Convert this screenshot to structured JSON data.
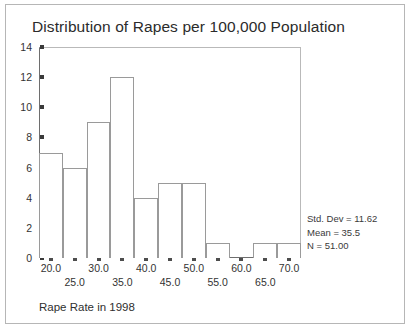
{
  "chart_data": {
    "type": "bar",
    "title": "Distribution of Rapes per 100,000 Population",
    "xlabel": "Rape Rate in 1998",
    "ylabel": "",
    "grid": false,
    "legend": "none",
    "xlim": [
      17.5,
      72.5
    ],
    "ylim": [
      0,
      14
    ],
    "bin_width": 5,
    "bin_starts": [
      17.5,
      22.5,
      27.5,
      32.5,
      37.5,
      42.5,
      47.5,
      52.5,
      57.5,
      62.5,
      67.5
    ],
    "categories": [
      "17.5-22.5",
      "22.5-27.5",
      "27.5-32.5",
      "32.5-37.5",
      "37.5-42.5",
      "42.5-47.5",
      "47.5-52.5",
      "52.5-57.5",
      "57.5-62.5",
      "62.5-67.5",
      "67.5-72.5"
    ],
    "values": [
      7,
      6,
      9,
      12,
      4,
      5,
      5,
      1,
      0,
      1,
      1
    ],
    "xticks": [
      {
        "value": 20.0,
        "label": "20.0",
        "row": 0
      },
      {
        "value": 25.0,
        "label": "25.0",
        "row": 1
      },
      {
        "value": 30.0,
        "label": "30.0",
        "row": 0
      },
      {
        "value": 35.0,
        "label": "35.0",
        "row": 1
      },
      {
        "value": 40.0,
        "label": "40.0",
        "row": 0
      },
      {
        "value": 45.0,
        "label": "45.0",
        "row": 1
      },
      {
        "value": 50.0,
        "label": "50.0",
        "row": 0
      },
      {
        "value": 55.0,
        "label": "55.0",
        "row": 1
      },
      {
        "value": 60.0,
        "label": "60.0",
        "row": 0
      },
      {
        "value": 65.0,
        "label": "65.0",
        "row": 1
      },
      {
        "value": 70.0,
        "label": "70.0",
        "row": 0
      }
    ],
    "yticks": [
      {
        "value": 0,
        "label": "0"
      },
      {
        "value": 2,
        "label": "2"
      },
      {
        "value": 4,
        "label": "4"
      },
      {
        "value": 6,
        "label": "6"
      },
      {
        "value": 8,
        "label": "8"
      },
      {
        "value": 10,
        "label": "10"
      },
      {
        "value": 12,
        "label": "12"
      },
      {
        "value": 14,
        "label": "14"
      }
    ],
    "annotations": {
      "std_dev": "Std. Dev = 11.62",
      "mean": "Mean = 35.5",
      "n": "N = 51.00"
    },
    "colors": {
      "bar_fill": "#ffffff",
      "bar_edge": "#9a9a9a",
      "axis": "#6e6e6e",
      "text": "#333333",
      "frame": "#b6b6b6"
    }
  }
}
